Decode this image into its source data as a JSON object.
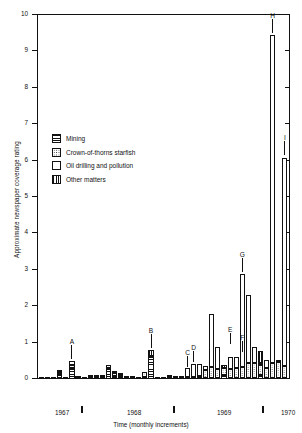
{
  "chart_data": {
    "type": "bar",
    "title": "",
    "xlabel": "Time (monthly increments)",
    "ylabel": "Approximate newspaper coverage rating",
    "ylim": [
      0,
      10
    ],
    "yticks": [
      0,
      1,
      2,
      3,
      4,
      5,
      6,
      7,
      8,
      9,
      10
    ],
    "ytick_labels": [
      "0",
      "1",
      "2",
      "3",
      "4",
      "5",
      "6",
      "7",
      "8",
      "9",
      "10"
    ],
    "grid": false,
    "stacked": true,
    "legend_position": "upper-left-inside",
    "series": [
      {
        "name": "Mining",
        "pattern": "horizontal-lines"
      },
      {
        "name": "Crown-of-thorns starfish",
        "pattern": "dots"
      },
      {
        "name": "Oil drilling and pollution",
        "pattern": "white"
      },
      {
        "name": "Other matters",
        "pattern": "vertical-lines"
      }
    ],
    "x_axis_year_labels": [
      "1967",
      "1968",
      "1969",
      "1970"
    ],
    "x_axis_year_positions_px": [
      55,
      127,
      217,
      281
    ],
    "x_axis_tick_positions_px": [
      81,
      173,
      262
    ],
    "bars": [
      {
        "i": 0,
        "mining": 0.03,
        "starfish": 0.0,
        "oil": 0.0,
        "other": 0.0
      },
      {
        "i": 1,
        "mining": 0.03,
        "starfish": 0.0,
        "oil": 0.0,
        "other": 0.0
      },
      {
        "i": 2,
        "mining": 0.04,
        "starfish": 0.0,
        "oil": 0.0,
        "other": 0.0
      },
      {
        "i": 3,
        "mining": 0.13,
        "starfish": 0.05,
        "oil": 0.04,
        "other": 0.0
      },
      {
        "i": 4,
        "mining": 0.04,
        "starfish": 0.0,
        "oil": 0.0,
        "other": 0.0
      },
      {
        "i": 5,
        "mining": 0.3,
        "starfish": 0.08,
        "oil": 0.12,
        "other": 0.0
      },
      {
        "i": 6,
        "mining": 0.03,
        "starfish": 0.02,
        "oil": 0.0,
        "other": 0.0
      },
      {
        "i": 7,
        "mining": 0.02,
        "starfish": 0.0,
        "oil": 0.0,
        "other": 0.0
      },
      {
        "i": 8,
        "mining": 0.05,
        "starfish": 0.05,
        "oil": 0.0,
        "other": 0.0
      },
      {
        "i": 9,
        "mining": 0.05,
        "starfish": 0.05,
        "oil": 0.0,
        "other": 0.0
      },
      {
        "i": 10,
        "mining": 0.06,
        "starfish": 0.05,
        "oil": 0.0,
        "other": 0.0
      },
      {
        "i": 11,
        "mining": 0.29,
        "starfish": 0.1,
        "oil": 0.0,
        "other": 0.0
      },
      {
        "i": 12,
        "mining": 0.09,
        "starfish": 0.08,
        "oil": 0.0,
        "other": 0.05
      },
      {
        "i": 13,
        "mining": 0.06,
        "starfish": 0.05,
        "oil": 0.0,
        "other": 0.05
      },
      {
        "i": 14,
        "mining": 0.04,
        "starfish": 0.02,
        "oil": 0.0,
        "other": 0.0
      },
      {
        "i": 15,
        "mining": 0.02,
        "starfish": 0.02,
        "oil": 0.0,
        "other": 0.0
      },
      {
        "i": 16,
        "mining": 0.04,
        "starfish": 0.0,
        "oil": 0.0,
        "other": 0.0
      },
      {
        "i": 17,
        "mining": 0.06,
        "starfish": 0.12,
        "oil": 0.0,
        "other": 0.0
      },
      {
        "i": 18,
        "mining": 0.62,
        "starfish": 0.0,
        "oil": 0.0,
        "other": 0.18
      },
      {
        "i": 19,
        "mining": 0.03,
        "starfish": 0.0,
        "oil": 0.0,
        "other": 0.0
      },
      {
        "i": 20,
        "mining": 0.02,
        "starfish": 0.0,
        "oil": 0.0,
        "other": 0.0
      },
      {
        "i": 21,
        "mining": 0.05,
        "starfish": 0.02,
        "oil": 0.0,
        "other": 0.0
      },
      {
        "i": 22,
        "mining": 0.04,
        "starfish": 0.02,
        "oil": 0.0,
        "other": 0.0
      },
      {
        "i": 23,
        "mining": 0.03,
        "starfish": 0.02,
        "oil": 0.0,
        "other": 0.0
      },
      {
        "i": 24,
        "mining": 0.03,
        "starfish": 0.03,
        "oil": 0.25,
        "other": 0.0
      },
      {
        "i": 25,
        "mining": 0.02,
        "starfish": 0.03,
        "oil": 0.35,
        "other": 0.0
      },
      {
        "i": 26,
        "mining": 0.03,
        "starfish": 0.04,
        "oil": 0.34,
        "other": 0.0
      },
      {
        "i": 27,
        "mining": 0.02,
        "starfish": 0.23,
        "oil": 0.12,
        "other": 0.0
      },
      {
        "i": 28,
        "mining": 0.02,
        "starfish": 0.31,
        "oil": 1.47,
        "other": 0.0
      },
      {
        "i": 29,
        "mining": 0.03,
        "starfish": 0.25,
        "oil": 0.6,
        "other": 0.0
      },
      {
        "i": 30,
        "mining": 0.11,
        "starfish": 0.18,
        "oil": 0.0,
        "other": 0.1
      },
      {
        "i": 31,
        "mining": 0.03,
        "starfish": 0.25,
        "oil": 0.33,
        "other": 0.0
      },
      {
        "i": 32,
        "mining": 0.02,
        "starfish": 0.28,
        "oil": 0.3,
        "other": 0.0
      },
      {
        "i": 33,
        "mining": 0.03,
        "starfish": 0.3,
        "oil": 2.55,
        "other": 0.0
      },
      {
        "i": 34,
        "mining": 0.04,
        "starfish": 0.4,
        "oil": 1.88,
        "other": 0.0
      },
      {
        "i": 35,
        "mining": 0.03,
        "starfish": 0.42,
        "oil": 0.43,
        "other": 0.0
      },
      {
        "i": 36,
        "mining": 0.1,
        "starfish": 0.28,
        "oil": 0.05,
        "other": 0.35
      },
      {
        "i": 37,
        "mining": 0.03,
        "starfish": 0.26,
        "oil": 0.22,
        "other": 0.0
      },
      {
        "i": 38,
        "mining": 0.03,
        "starfish": 0.4,
        "oil": 9.02,
        "other": 0.0
      },
      {
        "i": 39,
        "mining": 0.03,
        "starfish": 0.45,
        "oil": 0.02,
        "other": 0.0
      },
      {
        "i": 40,
        "mining": 0.03,
        "starfish": 0.32,
        "oil": 5.73,
        "other": 0.0
      }
    ],
    "annotations": [
      {
        "label": "A",
        "bar_index": 5,
        "value": 0.5
      },
      {
        "label": "B",
        "bar_index": 18,
        "value": 0.8
      },
      {
        "label": "C",
        "bar_index": 24,
        "value": 0.28
      },
      {
        "label": "D",
        "bar_index": 25,
        "value": 0.4
      },
      {
        "label": "E",
        "bar_index": 31,
        "value": 0.9
      },
      {
        "label": "F",
        "bar_index": 33,
        "value": 0.68
      },
      {
        "label": "G",
        "bar_index": 33,
        "value": 2.88
      },
      {
        "label": "H",
        "bar_index": 38,
        "value": 9.45
      },
      {
        "label": "I",
        "bar_index": 40,
        "value": 6.1
      }
    ]
  },
  "legend": {
    "items": [
      {
        "label": "Mining",
        "swatch": "mining-swatch-icon"
      },
      {
        "label": "Crown-of-thorns starfish",
        "swatch": "starfish-swatch-icon"
      },
      {
        "label": "Oil drilling and pollution",
        "swatch": "oil-swatch-icon"
      },
      {
        "label": "Other matters",
        "swatch": "other-swatch-icon"
      }
    ]
  },
  "axes": {
    "y_title": "Approximate newspaper coverage rating",
    "x_title": "Time (monthly increments)"
  }
}
